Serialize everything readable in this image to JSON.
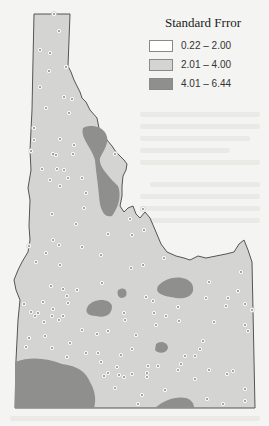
{
  "map": {
    "subject": "Idaho",
    "colors": {
      "background": "#f4f4f2",
      "state_fill": "#d4d4d2",
      "outline": "#555555",
      "high_error": "#8f8f8d",
      "station": "#ffffff"
    }
  },
  "legend": {
    "title": "Standard Frror",
    "items": [
      {
        "label": "0.22 – 2.00",
        "color": "#ffffff"
      },
      {
        "label": "2.01 – 4.00",
        "color": "#d4d4d2"
      },
      {
        "label": "4.01 – 6.44",
        "color": "#8f8f8d"
      }
    ]
  }
}
